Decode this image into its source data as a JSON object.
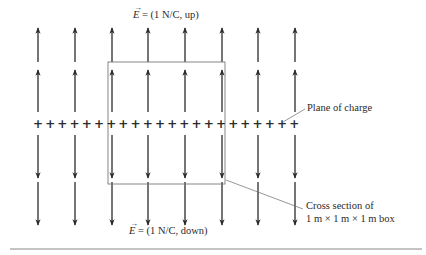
{
  "figure": {
    "top_label": {
      "symbol": "E",
      "text": " = (1 N/C, up)"
    },
    "bottom_label": {
      "symbol": "E",
      "text": " = (1 N/C, down)"
    },
    "plane_label": "Plane of charge",
    "box_label_line1": "Cross section of",
    "box_label_line2": "1 m × 1 m × 1 m box",
    "charge_symbol": "+",
    "colors": {
      "arrow": "#2b2b2b",
      "box": "#7a7a7a",
      "leader": "#6a6a6a",
      "rule": "#b0b0b0"
    },
    "arrow_columns_x": [
      38,
      75,
      112,
      148,
      185,
      222,
      258,
      295
    ],
    "plus_count": 22,
    "plus_start_x": 38,
    "plus_spacing": 12.2,
    "plane_y": 124,
    "box": {
      "x": 108,
      "y": 62,
      "width": 117,
      "height": 122
    }
  }
}
